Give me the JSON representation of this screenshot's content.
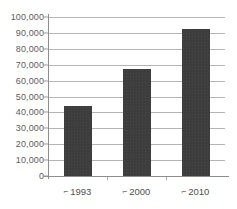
{
  "chart_data": {
    "type": "bar",
    "title": "",
    "subtitle": "",
    "xlabel": "",
    "ylabel": "",
    "categories": [
      "1993",
      "2000",
      "2010"
    ],
    "values": [
      44000,
      67000,
      92500
    ],
    "ylim": [
      0,
      100000
    ],
    "ytick_step": 10000,
    "ytick_labels": [
      "100,000",
      "90,000",
      "80,000",
      "70,000",
      "60,000",
      "50,000",
      "40,000",
      "30,000",
      "20,000",
      "10,000",
      "0"
    ],
    "ytick_values": [
      100000,
      90000,
      80000,
      70000,
      60000,
      50000,
      40000,
      30000,
      20000,
      10000,
      0
    ],
    "xtick_labels": [
      "1993",
      "2000",
      "2010"
    ],
    "xtick_prefix_glyph": "⌐",
    "grid": true,
    "grid_axis": "y",
    "legend": false,
    "legend_position": "none",
    "series": [
      {
        "name": "",
        "values": [
          44000,
          67000,
          92500
        ]
      }
    ],
    "colors": {
      "bar_fill": "#3d3d3d",
      "gridline": "#b4b4b4",
      "axis_line": "#8d8d8d",
      "tick_label": "#5c5c5c",
      "category_label": "#4f4f4f",
      "background": "#ffffff"
    }
  }
}
